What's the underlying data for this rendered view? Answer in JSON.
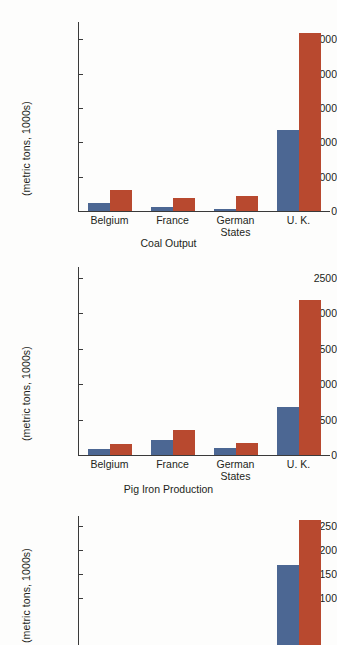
{
  "figure": {
    "ylabel": "(metric tons, 1000s)",
    "colors": {
      "series_blue": "#4c6793",
      "series_red": "#b8492f",
      "axis": "#3a3a3a",
      "text": "#231f20",
      "background": "#fdfdfc"
    },
    "series_names": [
      "Series 1 (blue)",
      "Series 2 (red)"
    ]
  },
  "chart_data": [
    {
      "type": "bar",
      "title": "Coal Output",
      "xlabel": "",
      "ylabel": "(metric tons, 1000s)",
      "categories": [
        "Belgium",
        "France",
        "German\nStates",
        "U. K."
      ],
      "series": [
        {
          "name": "Series 1",
          "color": "#4c6793",
          "values": [
            2200,
            1300,
            600,
            23500
          ]
        },
        {
          "name": "Series 2",
          "color": "#b8492f",
          "values": [
            6200,
            3900,
            4300,
            51700
          ]
        }
      ],
      "ylim": [
        0,
        55000
      ],
      "yticks": [
        0,
        10000,
        20000,
        30000,
        40000,
        50000
      ],
      "ytick_labels": [
        "0",
        "10,000",
        "20,000",
        "30,000",
        "40,000",
        "50,000"
      ],
      "grid": false,
      "legend": "none"
    },
    {
      "type": "bar",
      "title": "Pig Iron Production",
      "xlabel": "",
      "ylabel": "(metric tons, 1000s)",
      "categories": [
        "Belgium",
        "France",
        "German\nStates",
        "U. K."
      ],
      "series": [
        {
          "name": "Series 1",
          "color": "#4c6793",
          "values": [
            80,
            205,
            95,
            675
          ]
        },
        {
          "name": "Series 2",
          "color": "#b8492f",
          "values": [
            155,
            350,
            170,
            2190
          ]
        }
      ],
      "ylim": [
        0,
        2650
      ],
      "yticks": [
        0,
        500,
        1000,
        1500,
        2000,
        2500
      ],
      "ytick_labels": [
        "0",
        "500",
        "1000",
        "1500",
        "2000",
        "2500"
      ],
      "grid": false,
      "legend": "none"
    },
    {
      "type": "bar",
      "title": "",
      "xlabel": "",
      "ylabel": "(metric tons, 1000s)",
      "categories": [
        "Belgium",
        "France",
        "German\nStates",
        "U. K."
      ],
      "series": [
        {
          "name": "Series 1",
          "color": "#4c6793",
          "values": [
            null,
            null,
            null,
            168
          ]
        },
        {
          "name": "Series 2",
          "color": "#b8492f",
          "values": [
            null,
            null,
            null,
            263
          ]
        }
      ],
      "ylim": [
        0,
        272
      ],
      "yticks": [
        100,
        150,
        200,
        250
      ],
      "ytick_labels": [
        "100",
        "150",
        "200",
        "250"
      ],
      "grid": false,
      "legend": "none",
      "note": "chart cropped at bottom edge of screenshot"
    }
  ]
}
